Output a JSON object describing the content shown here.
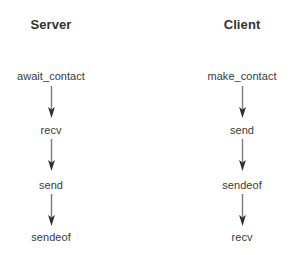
{
  "diagram": {
    "type": "sequence-flow",
    "background_color": "#ffffff",
    "text_color": "#3b3b3b",
    "arrow_line_color": "#7b7b7b",
    "arrow_head_color": "#2f2f2f",
    "columns": [
      {
        "id": "server",
        "title": "Server",
        "center_x": 51,
        "steps": [
          {
            "label": "await_contact",
            "y": 76
          },
          {
            "label": "recv",
            "y": 130
          },
          {
            "label": "send",
            "y": 185
          },
          {
            "label": "sendeof",
            "y": 237
          }
        ],
        "arrows": [
          {
            "from_step": "await_contact",
            "to_step": "recv",
            "y_start": 86,
            "y_end": 118
          },
          {
            "from_step": "recv",
            "to_step": "send",
            "y_start": 139,
            "y_end": 171
          },
          {
            "from_step": "send",
            "to_step": "sendeof",
            "y_start": 194,
            "y_end": 226
          }
        ]
      },
      {
        "id": "client",
        "title": "Client",
        "center_x": 242,
        "steps": [
          {
            "label": "make_contact",
            "y": 76
          },
          {
            "label": "send",
            "y": 130
          },
          {
            "label": "sendeof",
            "y": 185
          },
          {
            "label": "recv",
            "y": 237
          }
        ],
        "arrows": [
          {
            "from_step": "make_contact",
            "to_step": "send",
            "y_start": 86,
            "y_end": 118
          },
          {
            "from_step": "send",
            "to_step": "sendeof",
            "y_start": 139,
            "y_end": 171
          },
          {
            "from_step": "sendeof",
            "to_step": "recv",
            "y_start": 194,
            "y_end": 226
          }
        ]
      }
    ]
  }
}
